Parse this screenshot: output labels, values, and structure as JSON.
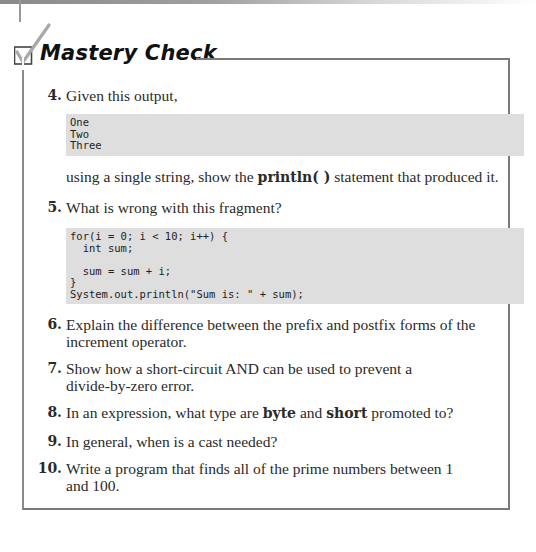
{
  "header": {
    "title": "Mastery Check",
    "icon": "checkbox-check-icon"
  },
  "questions": [
    {
      "number": "4.",
      "intro": "Given this output,",
      "code": "One\nTwo\nThree",
      "after_pre": "using a single string, show the ",
      "after_bold": "println( )",
      "after_post": " statement that produced it."
    },
    {
      "number": "5.",
      "intro": "What is wrong with this fragment?",
      "code": "for(i = 0; i < 10; i++) {\n  int sum;\n\n  sum = sum + i;\n}\nSystem.out.println(\"Sum is: \" + sum);"
    },
    {
      "number": "6.",
      "line1": "Explain the difference between the prefix and postfix forms of the",
      "line2": "increment operator."
    },
    {
      "number": "7.",
      "line1": "Show how a short-circuit AND can be used to prevent a",
      "line2": "divide-by-zero error."
    },
    {
      "number": "8.",
      "pre": "In an expression, what type are ",
      "bold1": "byte",
      "mid": " and ",
      "bold2": "short",
      "post": " promoted to?"
    },
    {
      "number": "9.",
      "text": "In general, when is a cast needed?"
    },
    {
      "number": "10.",
      "line1": "Write a program that finds all of the prime numbers between 1",
      "line2": "and 100."
    }
  ]
}
